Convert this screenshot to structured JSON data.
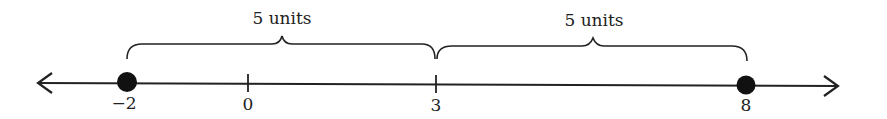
{
  "diagram": {
    "type": "number-line",
    "ticks": [
      {
        "value": -2,
        "label": "−2",
        "x": 127,
        "marked": true
      },
      {
        "value": 0,
        "label": "0",
        "x": 248,
        "marked": false
      },
      {
        "value": 3,
        "label": "3",
        "x": 436,
        "marked": false
      },
      {
        "value": 8,
        "label": "8",
        "x": 746,
        "marked": true
      }
    ],
    "braces": [
      {
        "from": -2,
        "to": 3,
        "label": "5 units"
      },
      {
        "from": 3,
        "to": 8,
        "label": "5 units"
      }
    ],
    "colors": {
      "line": "#222222",
      "point": "#111111"
    }
  }
}
